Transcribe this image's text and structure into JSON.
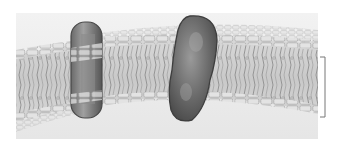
{
  "figure": {
    "colors": {
      "page_background": "#ffffff",
      "panel_background": "#eeeeee",
      "head_fill": "#dcdcdc",
      "head_stroke": "#9a9a9a",
      "tail_stroke": "#8c8c8c",
      "interior_fill": "#d2d2d2",
      "protein_dark": "#555555",
      "protein_mid": "#7a7a7a",
      "protein_light": "#b5b5b5",
      "bracket": "#777777"
    },
    "elements": {
      "small_protein": "transmembrane-protein-narrow",
      "large_protein": "transmembrane-protein-large",
      "bracket": "bilayer-thickness-bracket"
    }
  }
}
